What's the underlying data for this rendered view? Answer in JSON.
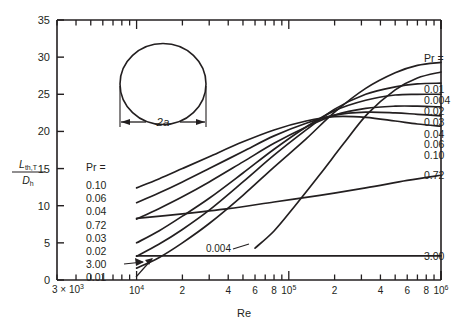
{
  "figure": {
    "inset_label": "2a",
    "inset_shape": "circle"
  },
  "axes": {
    "y_title_num": "L",
    "y_title_sub": "th,T",
    "y_title_den": "D",
    "y_title_den_sub": "h",
    "x_title": "Re",
    "y_ticks": [
      "0",
      "5",
      "10",
      "15",
      "20",
      "25",
      "30",
      "35"
    ],
    "x_start_label": "3 × 10",
    "x_start_exp": "3",
    "x_tick_labels": [
      "10",
      "2",
      "4",
      "6",
      "8",
      "10",
      "2",
      "4",
      "6",
      "8",
      "10"
    ],
    "x_tick_exps": [
      "4",
      "",
      "",
      "",
      "",
      "5",
      "",
      "",
      "",
      "",
      "6"
    ]
  },
  "legend_left": {
    "title": "Pr =",
    "items": [
      "0.10",
      "0.06",
      "0.04",
      "0.72",
      "0.03",
      "0.02",
      "3.00",
      "0.01"
    ]
  },
  "legend_right": {
    "title": "Pr =",
    "items": [
      "0.01",
      "0.004",
      "0.02",
      "0.03",
      "0.04",
      "0.06",
      "0.10"
    ]
  },
  "inline_labels": {
    "mid_curve": "0.004",
    "lower_curve": "0.72",
    "bottom_curve": "3.00"
  },
  "colors": {
    "ink": "#231f20",
    "background": "#ffffff"
  },
  "chart_data": {
    "type": "line",
    "title": "",
    "xlabel": "Re",
    "ylabel": "L_th,T / D_h",
    "xscale": "log",
    "xlim": [
      3000,
      1000000
    ],
    "ylim": [
      0,
      35
    ],
    "grid": false,
    "legend_position": "inline-right-and-left",
    "axis_tick_style": "log-minor-ticks-top-and-bottom",
    "series": [
      {
        "name": "0.01",
        "label_left": "0.01",
        "label_right": "0.01",
        "x": [
          10000,
          14000,
          20000,
          30000,
          50000,
          80000,
          130000,
          200000,
          320000,
          500000,
          700000,
          1000000
        ],
        "y": [
          1.6,
          3.0,
          5.0,
          7.6,
          11.4,
          15.2,
          19.0,
          22.6,
          25.8,
          27.9,
          28.9,
          29.3
        ]
      },
      {
        "name": "0.004",
        "label_mid": "0.004",
        "label_right": "0.004",
        "x": [
          60000,
          80000,
          110000,
          160000,
          230000,
          330000,
          500000,
          700000,
          1000000
        ],
        "y": [
          4.3,
          6.6,
          10.0,
          14.2,
          18.4,
          22.4,
          25.6,
          27.2,
          28.0
        ]
      },
      {
        "name": "0.02",
        "label_left": "0.02",
        "label_right": "0.02",
        "x": [
          10000,
          14000,
          20000,
          30000,
          50000,
          80000,
          130000,
          200000,
          320000,
          500000,
          700000,
          1000000
        ],
        "y": [
          3.2,
          4.8,
          6.8,
          9.4,
          13.2,
          16.8,
          20.2,
          23.0,
          25.0,
          26.0,
          26.4,
          26.5
        ]
      },
      {
        "name": "0.03",
        "label_left": "0.03",
        "label_right": "0.03",
        "x": [
          10000,
          14000,
          20000,
          30000,
          50000,
          80000,
          130000,
          200000,
          320000,
          500000,
          700000,
          1000000
        ],
        "y": [
          5.0,
          6.6,
          8.6,
          11.0,
          14.4,
          17.6,
          20.6,
          22.8,
          24.2,
          24.9,
          25.0,
          25.0
        ]
      },
      {
        "name": "0.04",
        "label_left": "0.04",
        "label_right": "0.04",
        "x": [
          10000,
          14000,
          20000,
          30000,
          50000,
          80000,
          130000,
          200000,
          320000,
          500000,
          700000,
          1000000
        ],
        "y": [
          8.2,
          9.6,
          11.2,
          13.2,
          15.9,
          18.4,
          20.6,
          22.2,
          23.1,
          23.4,
          23.4,
          23.3
        ]
      },
      {
        "name": "0.06",
        "label_left": "0.06",
        "label_right": "0.06",
        "x": [
          10000,
          14000,
          20000,
          30000,
          50000,
          80000,
          130000,
          200000,
          320000,
          500000,
          700000,
          1000000
        ],
        "y": [
          10.4,
          11.7,
          13.2,
          15.0,
          17.3,
          19.4,
          21.1,
          22.2,
          22.6,
          22.5,
          22.3,
          22.1
        ]
      },
      {
        "name": "0.10",
        "label_left": "0.10",
        "label_right": "0.10",
        "x": [
          10000,
          14000,
          20000,
          30000,
          50000,
          80000,
          130000,
          200000,
          320000,
          500000,
          700000,
          1000000
        ],
        "y": [
          12.4,
          13.6,
          15.0,
          16.6,
          18.6,
          20.2,
          21.4,
          22.0,
          21.9,
          21.4,
          21.0,
          20.7
        ]
      },
      {
        "name": "0.72",
        "label_left": "0.72",
        "label_right": "0.72",
        "x": [
          10000,
          20000,
          40000,
          80000,
          160000,
          320000,
          600000,
          1000000
        ],
        "y": [
          8.3,
          8.9,
          9.6,
          10.5,
          11.4,
          12.4,
          13.4,
          14.1
        ]
      },
      {
        "name": "3.00",
        "label_left": "3.00",
        "label_right": "3.00",
        "x": [
          10000,
          100000,
          1000000
        ],
        "y": [
          3.25,
          3.25,
          3.25
        ]
      }
    ]
  }
}
